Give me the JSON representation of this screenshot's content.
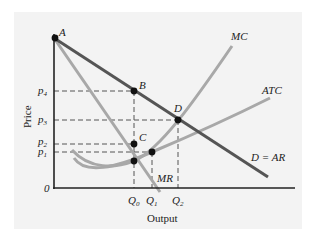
{
  "diagram": {
    "axes": {
      "x_label": "Output",
      "y_label": "Price",
      "origin_label": "0"
    },
    "price_ticks": [
      {
        "name": "p",
        "sub": "4",
        "y": 91
      },
      {
        "name": "p",
        "sub": "3",
        "y": 120
      },
      {
        "name": "p",
        "sub": "2",
        "y": 144
      },
      {
        "name": "p",
        "sub": "1",
        "y": 152
      }
    ],
    "quantity_ticks": [
      {
        "name": "Q",
        "sub": "0",
        "x": 134
      },
      {
        "name": "Q",
        "sub": "1",
        "x": 152
      },
      {
        "name": "Q",
        "sub": "2",
        "x": 178
      }
    ],
    "curves": {
      "demand": {
        "label": "D = AR",
        "color": "#555555"
      },
      "mr": {
        "label": "MR",
        "color": "#a8a8a8"
      },
      "mc": {
        "label": "MC",
        "color": "#a8a8a8"
      },
      "atc": {
        "label": "ATC",
        "color": "#a8a8a8"
      }
    },
    "points": [
      {
        "label": "A",
        "x": 54,
        "y": 38
      },
      {
        "label": "B",
        "x": 134,
        "y": 91
      },
      {
        "label": "C",
        "x": 134,
        "y": 144
      },
      {
        "label": "D",
        "x": 178,
        "y": 120
      }
    ],
    "unlabeled_points": [
      {
        "x": 152,
        "y": 152
      },
      {
        "x": 134,
        "y": 161
      }
    ]
  }
}
